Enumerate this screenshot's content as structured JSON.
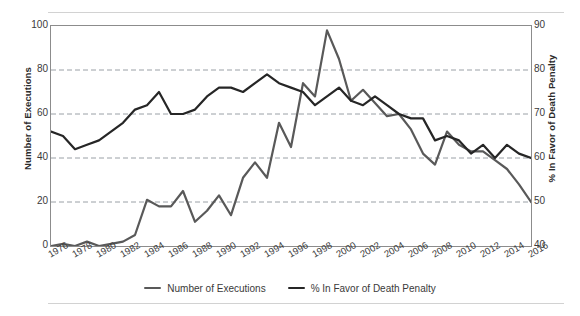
{
  "chart_data": {
    "type": "line",
    "title": "",
    "xlabel": "",
    "ylabel": "Number of Executions",
    "y2label": "% In Favor of Death Penalty",
    "grid": true,
    "legend_position": "bottom",
    "x": [
      1976,
      1977,
      1978,
      1979,
      1980,
      1981,
      1982,
      1983,
      1984,
      1985,
      1986,
      1987,
      1988,
      1989,
      1990,
      1991,
      1992,
      1993,
      1994,
      1995,
      1996,
      1997,
      1998,
      1999,
      2000,
      2001,
      2002,
      2003,
      2004,
      2005,
      2006,
      2007,
      2008,
      2009,
      2010,
      2011,
      2012,
      2013,
      2014,
      2015,
      2016
    ],
    "xtick_labels": [
      "1976",
      "1978",
      "1980",
      "1982",
      "1984",
      "1986",
      "1988",
      "1990",
      "1992",
      "1994",
      "1996",
      "1998",
      "2000",
      "2002",
      "2004",
      "2006",
      "2008",
      "2010",
      "2012",
      "2014",
      "2016"
    ],
    "ylim": [
      0,
      100
    ],
    "ytick_labels": [
      "0",
      "20",
      "40",
      "60",
      "80",
      "100"
    ],
    "y2lim": [
      40,
      90
    ],
    "y2tick_labels": [
      "40",
      "50",
      "60",
      "70",
      "80",
      "90"
    ],
    "series": [
      {
        "name": "Number of Executions",
        "axis": "left",
        "color": "#595959",
        "values": [
          0,
          1,
          0,
          2,
          0,
          1,
          2,
          5,
          21,
          18,
          18,
          25,
          11,
          16,
          23,
          14,
          31,
          38,
          31,
          56,
          45,
          74,
          68,
          98,
          85,
          66,
          71,
          65,
          59,
          60,
          53,
          42,
          37,
          52,
          46,
          43,
          43,
          39,
          35,
          28,
          20
        ]
      },
      {
        "name": "% In Favor of Death Penalty",
        "axis": "right",
        "color": "#262626",
        "values": [
          66,
          65,
          62,
          63,
          64,
          66,
          68,
          71,
          72,
          75,
          70,
          70,
          71,
          74,
          76,
          76,
          75,
          77,
          79,
          77,
          76,
          75,
          72,
          74,
          76,
          73,
          72,
          74,
          72,
          70,
          69,
          69,
          64,
          65,
          64,
          61,
          63,
          60,
          63,
          61,
          60
        ]
      }
    ]
  },
  "axes": {
    "left_title": "Number of Executions",
    "right_title": "% In Favor of Death Penalty",
    "left_ticks": [
      "100",
      "80",
      "60",
      "40",
      "20",
      "0"
    ],
    "right_ticks": [
      "90",
      "80",
      "70",
      "60",
      "50",
      "40"
    ]
  },
  "legend": {
    "items": [
      {
        "label": "Number of Executions",
        "color": "#595959"
      },
      {
        "label": "% In Favor of Death Penalty",
        "color": "#262626"
      }
    ]
  }
}
